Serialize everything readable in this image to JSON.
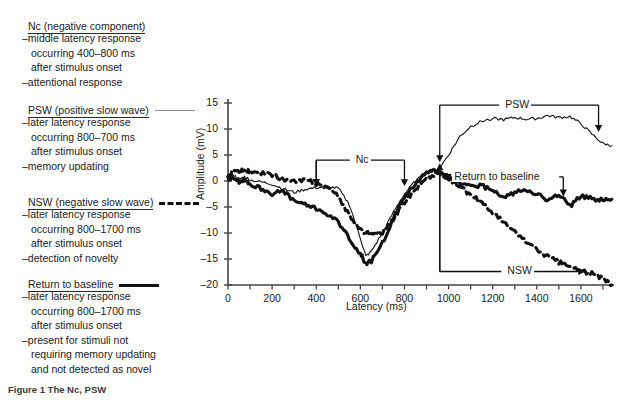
{
  "legend": {
    "blocks": [
      {
        "key": "nc",
        "title": "Nc (negative component)",
        "sample": "none",
        "lines": [
          {
            "text": "–middle latency response",
            "indent": false
          },
          {
            "text": "occurring 400–800 ms",
            "indent": true
          },
          {
            "text": "after stimulus onset",
            "indent": true
          },
          {
            "text": "–attentional response",
            "indent": false
          }
        ]
      },
      {
        "key": "psw",
        "title": "PSW (positive slow wave)",
        "sample": "thin-solid-line",
        "lines": [
          {
            "text": "–later latency response",
            "indent": false
          },
          {
            "text": "occurring 800–700 ms",
            "indent": true
          },
          {
            "text": "after stimulus onset",
            "indent": true
          },
          {
            "text": "–memory updating",
            "indent": false
          }
        ]
      },
      {
        "key": "nsw",
        "title": "NSW (negative slow wave)",
        "sample": "thick-dashed-line",
        "lines": [
          {
            "text": "–later latency response",
            "indent": false
          },
          {
            "text": "occurring 800–1700 ms",
            "indent": true
          },
          {
            "text": "after stimulus onset",
            "indent": true
          },
          {
            "text": "–detection of novelty",
            "indent": false
          }
        ]
      },
      {
        "key": "return",
        "title": "Return to baseline",
        "sample": "thick-solid-line",
        "lines": [
          {
            "text": "–later latency response",
            "indent": false
          },
          {
            "text": "occurring 800–1700 ms",
            "indent": true
          },
          {
            "text": "after stimulus onset",
            "indent": true
          },
          {
            "text": "–present for stimuli not",
            "indent": false
          },
          {
            "text": "requiring memory updating",
            "indent": true
          },
          {
            "text": "and not detected as novel",
            "indent": true
          }
        ]
      }
    ]
  },
  "caption": "Figure 1  The Nc, PSW",
  "chart_data": {
    "type": "line",
    "title": "",
    "xlabel": "Latency (ms)",
    "ylabel": "Amplitude (mV)",
    "xlim": [
      0,
      1750
    ],
    "ylim": [
      -20,
      15
    ],
    "xticks": [
      0,
      200,
      400,
      600,
      800,
      1000,
      1200,
      1400,
      1600
    ],
    "yticks": [
      15,
      10,
      5,
      0,
      -5,
      -10,
      -15,
      -20
    ],
    "minor_xtick_step": 100,
    "grid": false,
    "legend_position": "external-left",
    "annotations": [
      {
        "label": "Nc",
        "type": "bracket-down",
        "x_from": 400,
        "x_to": 800,
        "y_level": 4
      },
      {
        "label": "PSW",
        "type": "bracket-down",
        "x_from": 960,
        "x_to": 1660,
        "y_level": 14.5
      },
      {
        "label": "Return to baseline",
        "type": "bracket-down",
        "x_from": 980,
        "x_to": 1540,
        "y_level": 0.6
      },
      {
        "label": "NSW",
        "type": "bracket-up",
        "x_from": 960,
        "x_to": 1660,
        "y_level": -17.5
      }
    ],
    "series": [
      {
        "name": "PSW (positive slow wave)",
        "style": "thin-solid",
        "color": "#111111",
        "x": [
          0,
          25,
          50,
          75,
          100,
          150,
          200,
          250,
          300,
          350,
          400,
          450,
          500,
          550,
          600,
          625,
          650,
          700,
          750,
          800,
          850,
          900,
          950,
          1000,
          1050,
          1100,
          1150,
          1200,
          1250,
          1300,
          1350,
          1400,
          1450,
          1500,
          1550,
          1600,
          1650,
          1700,
          1740
        ],
        "y": [
          0.5,
          1.2,
          0.3,
          0.8,
          0.2,
          -0.2,
          -0.6,
          -1.5,
          -2.2,
          -1.6,
          -1.3,
          -1.1,
          -1.4,
          -4.5,
          -11.0,
          -14.5,
          -13.5,
          -10.0,
          -6.0,
          -2.5,
          0.0,
          1.5,
          2.0,
          5.0,
          8.5,
          10.5,
          11.5,
          12.0,
          11.8,
          12.2,
          11.9,
          12.0,
          12.6,
          12.2,
          12.4,
          11.0,
          9.0,
          7.2,
          6.8
        ]
      },
      {
        "name": "NSW (negative slow wave)",
        "style": "thick-dashed",
        "color": "#111111",
        "x": [
          0,
          25,
          50,
          75,
          100,
          150,
          200,
          250,
          300,
          350,
          400,
          450,
          500,
          550,
          600,
          650,
          700,
          750,
          800,
          850,
          900,
          950,
          1000,
          1050,
          1100,
          1150,
          1200,
          1250,
          1300,
          1350,
          1400,
          1450,
          1500,
          1550,
          1600,
          1650,
          1700,
          1740
        ],
        "y": [
          0.8,
          2.0,
          1.6,
          2.2,
          1.7,
          1.4,
          1.2,
          0.4,
          -0.2,
          0.2,
          -0.5,
          -1.2,
          -3.0,
          -6.5,
          -9.5,
          -10.2,
          -9.8,
          -7.5,
          -4.0,
          -1.5,
          0.5,
          1.6,
          0.2,
          -1.2,
          -2.6,
          -4.2,
          -6.0,
          -8.0,
          -9.8,
          -11.5,
          -13.2,
          -14.5,
          -15.6,
          -16.5,
          -17.2,
          -17.8,
          -18.8,
          -20.0
        ]
      },
      {
        "name": "Return to baseline",
        "style": "thick-solid",
        "color": "#111111",
        "x": [
          0,
          25,
          50,
          75,
          100,
          150,
          200,
          250,
          300,
          350,
          400,
          450,
          500,
          550,
          600,
          625,
          650,
          700,
          750,
          800,
          850,
          900,
          950,
          1000,
          1050,
          1100,
          1150,
          1200,
          1250,
          1300,
          1350,
          1400,
          1450,
          1500,
          1550,
          1600,
          1650,
          1700,
          1740
        ],
        "y": [
          0.4,
          0.9,
          -0.3,
          0.4,
          -0.6,
          -1.4,
          -2.4,
          -2.0,
          -3.8,
          -4.6,
          -5.2,
          -6.4,
          -8.0,
          -11.0,
          -14.0,
          -15.8,
          -15.5,
          -12.0,
          -7.0,
          -3.0,
          -0.5,
          1.5,
          2.2,
          1.0,
          -0.2,
          -1.2,
          -0.8,
          -2.0,
          -3.2,
          -2.2,
          -1.5,
          -2.4,
          -3.8,
          -2.6,
          -4.8,
          -3.0,
          -3.4,
          -3.6,
          -3.5
        ]
      }
    ]
  }
}
